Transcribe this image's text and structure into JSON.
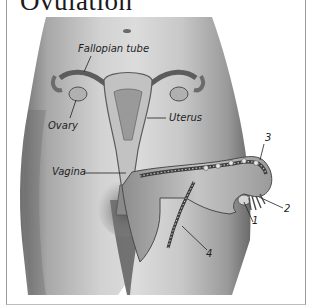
{
  "figure": {
    "title": "Ovulation",
    "labels": {
      "fallopian_tube": "Fallopian tube",
      "ovary": "Ovary",
      "uterus": "Uterus",
      "vagina": "Vagina"
    },
    "callouts": [
      "1",
      "2",
      "3",
      "4"
    ]
  }
}
